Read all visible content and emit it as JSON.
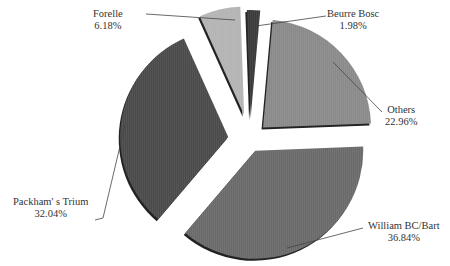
{
  "chart_data": {
    "type": "pie",
    "title": "",
    "exploded": true,
    "categories": [
      "Beurre Bosc",
      "Others",
      "William BC/Bart",
      "Packham's Trium",
      "Forelle"
    ],
    "values": [
      1.98,
      22.96,
      36.84,
      32.04,
      6.18
    ],
    "labels": [
      "1.98%",
      "22.96%",
      "36.84%",
      "32.04%",
      "6.18%"
    ],
    "colors": [
      "#3a3a3a",
      "#8a8a8a",
      "#6a6a6a",
      "#4a4a4a",
      "#b4b4b4"
    ],
    "legend": "none"
  },
  "labels": {
    "beurre": {
      "name": "Beurre Bosc",
      "pct": "1.98%"
    },
    "others": {
      "name": "Others",
      "pct": "22.96%"
    },
    "william": {
      "name": "William BC/Bart",
      "pct": "36.84%"
    },
    "packham": {
      "name": "Packham' s Trium",
      "pct": "32.04%"
    },
    "forelle": {
      "name": "Forelle",
      "pct": "6.18%"
    }
  }
}
